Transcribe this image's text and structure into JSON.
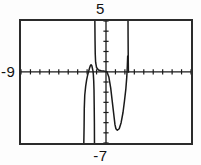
{
  "screen": {
    "width": 201,
    "height": 165,
    "background_color": "#fdfdfd",
    "frame_color": "#2b2b2b",
    "trace_color": "#1a1a1a"
  },
  "labels": {
    "ymax": "5",
    "ymin": "-7",
    "xmin": "-9"
  },
  "chart_data": {
    "type": "line",
    "title": "",
    "xlabel": "",
    "ylabel": "",
    "grid": false,
    "legend": null,
    "axis_style": "tick-marks",
    "xlim": [
      -9,
      9
    ],
    "ylim": [
      -7,
      5
    ],
    "xtick_interval": 1,
    "ytick_interval": 1,
    "annotations": [
      {
        "text": "5",
        "position": "top-center",
        "meaning": "Ymax"
      },
      {
        "text": "-9",
        "position": "left-of-axis",
        "meaning": "Xmin"
      },
      {
        "text": "-7",
        "position": "bottom-center",
        "meaning": "Ymin"
      }
    ],
    "series": [
      {
        "name": "y",
        "description": "rational function with vertical asymptotes near x = -1.2 and x = 2.3",
        "asymptotes_x": [
          -1.2,
          2.3
        ],
        "local_max": {
          "x": -1.6,
          "y": 0.7
        },
        "local_min": {
          "x": 1.0,
          "y": -5.6
        },
        "x_intercepts": [
          -1.85,
          -1.35,
          0.1
        ],
        "branches": [
          {
            "name": "left-descending-branch",
            "points": [
              [
                -2.35,
                -7.0
              ],
              [
                -2.32,
                -5.4
              ],
              [
                -2.3,
                -3.6
              ],
              [
                -2.25,
                -2.3
              ],
              [
                -2.15,
                -1.4
              ],
              [
                -2.05,
                -0.8
              ],
              [
                -1.95,
                -0.35
              ],
              [
                -1.85,
                0.0
              ],
              [
                -1.75,
                0.35
              ],
              [
                -1.65,
                0.62
              ],
              [
                -1.58,
                0.7
              ],
              [
                -1.5,
                0.6
              ],
              [
                -1.44,
                0.35
              ],
              [
                -1.38,
                0.1
              ],
              [
                -1.34,
                -0.25
              ],
              [
                -1.3,
                -0.9
              ],
              [
                -1.27,
                -1.8
              ],
              [
                -1.25,
                -3.2
              ],
              [
                -1.23,
                -5.0
              ],
              [
                -1.22,
                -7.0
              ]
            ]
          },
          {
            "name": "center-rising-to-asymptote-branch",
            "points": [
              [
                -1.18,
                5.0
              ],
              [
                -1.16,
                3.1
              ],
              [
                -1.14,
                1.8
              ],
              [
                -1.1,
                0.95
              ],
              [
                -1.0,
                0.42
              ],
              [
                -0.8,
                0.18
              ],
              [
                -0.5,
                0.1
              ],
              [
                -0.2,
                0.07
              ],
              [
                0.1,
                0.0
              ],
              [
                0.3,
                -0.5
              ],
              [
                0.5,
                -1.6
              ],
              [
                0.65,
                -2.8
              ],
              [
                0.8,
                -4.0
              ],
              [
                0.95,
                -5.2
              ],
              [
                1.05,
                -5.6
              ],
              [
                1.2,
                -5.75
              ],
              [
                1.4,
                -5.6
              ],
              [
                1.6,
                -5.0
              ],
              [
                1.8,
                -4.0
              ],
              [
                1.95,
                -2.9
              ],
              [
                2.1,
                -1.7
              ],
              [
                2.2,
                -0.5
              ],
              [
                2.26,
                0.6
              ],
              [
                2.3,
                1.6
              ]
            ]
          },
          {
            "name": "right-vertical-branch",
            "points": [
              [
                2.33,
                5.0
              ],
              [
                2.34,
                3.3
              ],
              [
                2.35,
                2.0
              ],
              [
                2.36,
                0.9
              ],
              [
                2.37,
                0.2
              ],
              [
                2.38,
                -0.1
              ]
            ]
          }
        ]
      }
    ]
  }
}
